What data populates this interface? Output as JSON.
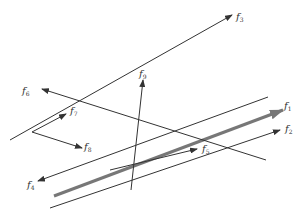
{
  "diagram": {
    "type": "force vectors / lines in plane",
    "colors": {
      "line": "#333333",
      "thick": "#777777",
      "background": "#ffffff"
    },
    "vectors": [
      {
        "id": "f1",
        "label": "f",
        "sub": "1",
        "x1": 54,
        "y1": 196,
        "x2": 283,
        "y2": 110,
        "thick": true,
        "label_x": 284,
        "label_y": 101
      },
      {
        "id": "f2",
        "label": "f",
        "sub": "2",
        "x1": 50,
        "y1": 208,
        "x2": 280,
        "y2": 130,
        "thick": false,
        "label_x": 285,
        "label_y": 124
      },
      {
        "id": "f3",
        "label": "f",
        "sub": "3",
        "x1": 10,
        "y1": 140,
        "x2": 232,
        "y2": 15,
        "thick": false,
        "label_x": 236,
        "label_y": 12
      },
      {
        "id": "f4",
        "label": "f",
        "sub": "4",
        "x1": 268,
        "y1": 97,
        "x2": 38,
        "y2": 181,
        "thick": false,
        "label_x": 27,
        "label_y": 180
      },
      {
        "id": "f5",
        "label": "f",
        "sub": "5",
        "x1": 110,
        "y1": 170,
        "x2": 197,
        "y2": 149,
        "thick": false,
        "label_x": 202,
        "label_y": 144
      },
      {
        "id": "f6",
        "label": "f",
        "sub": "6",
        "x1": 266,
        "y1": 160,
        "x2": 42,
        "y2": 89,
        "thick": false,
        "label_x": 22,
        "label_y": 86
      },
      {
        "id": "f7",
        "label": "f",
        "sub": "7",
        "x1": 32,
        "y1": 132,
        "x2": 66,
        "y2": 114,
        "thick": false,
        "label_x": 70,
        "label_y": 106
      },
      {
        "id": "f8",
        "label": "f",
        "sub": "8",
        "x1": 32,
        "y1": 132,
        "x2": 82,
        "y2": 148,
        "thick": false,
        "label_x": 84,
        "label_y": 142
      },
      {
        "id": "f9",
        "label": "f",
        "sub": "9",
        "x1": 131,
        "y1": 190,
        "x2": 143,
        "y2": 80,
        "thick": false,
        "label_x": 139,
        "label_y": 69
      }
    ]
  }
}
